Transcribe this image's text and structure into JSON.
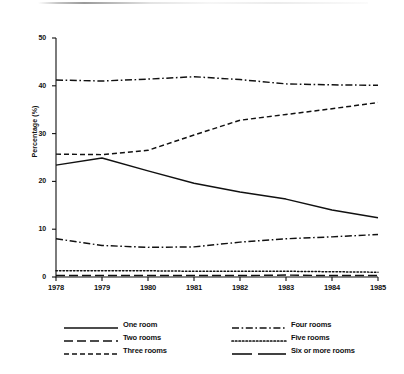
{
  "figure": {
    "axis_title_y": "Percentage (%)",
    "ink_color": "#111111"
  },
  "axes": {
    "y_ticks": [
      "0",
      "10",
      "20",
      "30",
      "40",
      "50"
    ],
    "x_ticks": [
      "1978",
      "1979",
      "1980",
      "1981",
      "1982",
      "1983",
      "1984",
      "1985"
    ]
  },
  "legend": {
    "left_column": [
      {
        "label": "One room",
        "style": "solid"
      },
      {
        "label": "Two rooms",
        "style": "long-dash"
      },
      {
        "label": "Three rooms",
        "style": "dash"
      }
    ],
    "right_column": [
      {
        "label": "Four rooms",
        "style": "dash-dot"
      },
      {
        "label": "Five rooms",
        "style": "dotted"
      },
      {
        "label": "Six or more rooms",
        "style": "double-long-dash"
      }
    ]
  },
  "chart_data": {
    "type": "line",
    "title": "",
    "subtitle": "",
    "xlabel": "",
    "ylabel": "Percentage (%)",
    "x": [
      1978,
      1979,
      1980,
      1981,
      1982,
      1983,
      1984,
      1985
    ],
    "xlim": [
      1978,
      1985
    ],
    "ylim": [
      0,
      50
    ],
    "y_ticks": [
      0,
      10,
      20,
      30,
      40,
      50
    ],
    "grid": false,
    "legend_position": "below-plot-two-columns",
    "series": [
      {
        "name": "One room",
        "style": "solid",
        "values": [
          23.4,
          24.9,
          22.2,
          19.6,
          17.8,
          16.3,
          14.0,
          12.4
        ]
      },
      {
        "name": "Two rooms",
        "style": "dash-dot",
        "values": [
          8.0,
          6.6,
          6.2,
          6.3,
          7.3,
          8.0,
          8.4,
          8.9
        ]
      },
      {
        "name": "Three rooms",
        "style": "dash",
        "values": [
          25.7,
          25.6,
          26.5,
          29.7,
          32.8,
          34.0,
          35.2,
          36.5
        ]
      },
      {
        "name": "Four rooms",
        "style": "dash-dot",
        "values": [
          41.2,
          41.0,
          41.4,
          41.9,
          41.3,
          40.4,
          40.2,
          40.1
        ]
      },
      {
        "name": "Five rooms",
        "style": "dotted",
        "values": [
          1.3,
          1.3,
          1.3,
          1.2,
          1.2,
          1.2,
          1.1,
          1.0
        ]
      },
      {
        "name": "Six or more rooms",
        "style": "long-dash",
        "values": [
          0.3,
          0.3,
          0.3,
          0.3,
          0.3,
          0.4,
          0.3,
          0.3
        ]
      }
    ]
  }
}
